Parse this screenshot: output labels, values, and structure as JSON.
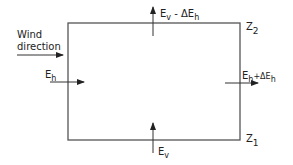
{
  "diagram": {
    "wind_label_line1": "Wind",
    "wind_label_line2": "direction",
    "left_flux": {
      "main": "E",
      "sub": "h"
    },
    "right_flux": {
      "main": "E",
      "sub": "h",
      "op": "+ΔE",
      "sub2": "h"
    },
    "top_flux": {
      "main": "E",
      "sub": "v",
      "op": " - ΔE",
      "sub2": "h"
    },
    "bottom_flux": {
      "main": "E",
      "sub": "v"
    },
    "top_level": {
      "main": "Z",
      "sub": "2"
    },
    "bottom_level": {
      "main": "Z",
      "sub": "1"
    },
    "colors": {
      "line": "#555555",
      "text": "#222222"
    }
  }
}
